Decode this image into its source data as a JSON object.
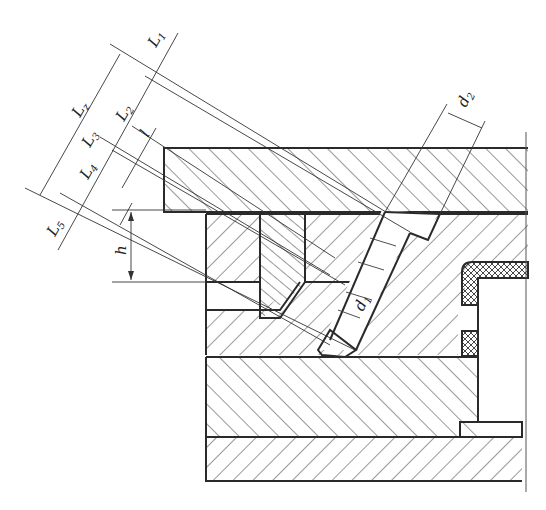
{
  "figure": {
    "type": "technical-drawing",
    "ink_color": "#2a2a2a",
    "background_color": "#ffffff"
  },
  "dimensions": {
    "L1": {
      "main": "L",
      "sub": "1"
    },
    "L2": {
      "main": "L",
      "sub": "2"
    },
    "L3": {
      "main": "L",
      "sub": "3"
    },
    "L4": {
      "main": "L",
      "sub": "4"
    },
    "L5": {
      "main": "L",
      "sub": "5"
    },
    "Lz": {
      "main": "L",
      "sub": "z"
    },
    "l": {
      "main": "l"
    },
    "h": {
      "main": "h"
    },
    "d1": {
      "main": "d",
      "sub": "1"
    },
    "d2": {
      "main": "d",
      "sub": "2"
    }
  }
}
